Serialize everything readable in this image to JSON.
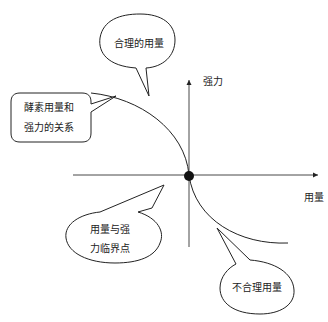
{
  "diagram": {
    "axes": {
      "x_label": "用量",
      "y_label": "强力"
    },
    "callouts": {
      "reasonable_dosage": "合理的用量",
      "relationship": [
        "酵素用量和",
        "强力的关系"
      ],
      "critical_point": [
        "用量与强",
        "力临界点"
      ],
      "unreasonable_dosage": "不合理用量"
    },
    "colors": {
      "line": "#222222",
      "background": "#ffffff"
    }
  }
}
